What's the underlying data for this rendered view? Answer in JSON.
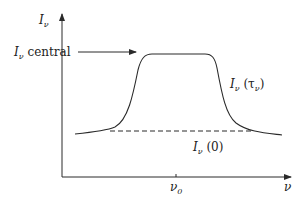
{
  "diagram": {
    "type": "spectral line profile",
    "y_axis": {
      "label": "I",
      "label_sub": "ν"
    },
    "x_axis": {
      "label": "ν",
      "tick_label": "ν",
      "tick_label_sub": "0"
    },
    "central_label": {
      "main": "I",
      "sub": "ν",
      "suffix": " central"
    },
    "curve_label": {
      "main": "I",
      "sub": "ν",
      "arg_open": " (τ",
      "arg_sub": "ν",
      "arg_close": ")"
    },
    "baseline_label": {
      "main": "I",
      "sub": "ν",
      "arg": " (0)"
    },
    "colors": {
      "line": "#2a2a2a",
      "background": "#ffffff"
    }
  }
}
